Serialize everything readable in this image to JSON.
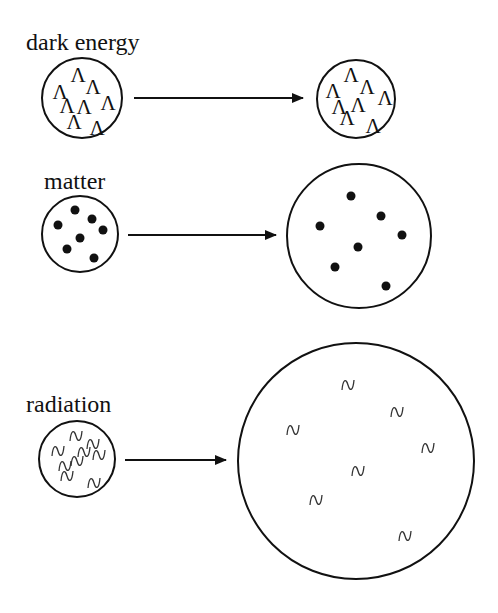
{
  "rows": [
    {
      "label": "dark energy",
      "symbol": "Λ",
      "before": {
        "cx": 82,
        "cy": 98,
        "r": 40
      },
      "after": {
        "cx": 356,
        "cy": 99,
        "r": 39
      },
      "arrow": {
        "x1": 134,
        "x2": 303,
        "y": 98
      },
      "before_marks": [
        [
          60,
          91
        ],
        [
          78,
          74
        ],
        [
          93,
          86
        ],
        [
          108,
          102
        ],
        [
          84,
          106
        ],
        [
          74,
          121
        ],
        [
          97,
          127
        ],
        [
          67,
          105
        ]
      ],
      "after_marks": [
        [
          333,
          90
        ],
        [
          351,
          74
        ],
        [
          367,
          86
        ],
        [
          385,
          97
        ],
        [
          358,
          104
        ],
        [
          347,
          117
        ],
        [
          373,
          125
        ],
        [
          339,
          106
        ]
      ]
    },
    {
      "label": "matter",
      "symbol": "•",
      "before": {
        "cx": 80,
        "cy": 234,
        "r": 38
      },
      "after": {
        "cx": 359,
        "cy": 236,
        "r": 72
      },
      "arrow": {
        "x1": 128,
        "x2": 276,
        "y": 235
      },
      "before_marks": [
        [
          75,
          210
        ],
        [
          58,
          225
        ],
        [
          92,
          219
        ],
        [
          103,
          230
        ],
        [
          80,
          238
        ],
        [
          67,
          249
        ],
        [
          94,
          258
        ]
      ],
      "after_marks": [
        [
          351,
          196
        ],
        [
          320,
          226
        ],
        [
          381,
          216
        ],
        [
          402,
          235
        ],
        [
          358,
          247
        ],
        [
          335,
          267
        ],
        [
          386,
          286
        ]
      ]
    },
    {
      "label": "radiation",
      "symbol": "∿",
      "before": {
        "cx": 77,
        "cy": 459,
        "r": 38
      },
      "after": {
        "cx": 356,
        "cy": 461,
        "r": 118
      },
      "arrow": {
        "x1": 125,
        "x2": 226,
        "y": 460
      },
      "before_marks": [
        [
          76,
          436
        ],
        [
          58,
          451
        ],
        [
          93,
          444
        ],
        [
          99,
          455
        ],
        [
          77,
          461
        ],
        [
          67,
          476
        ],
        [
          94,
          483
        ],
        [
          65,
          466
        ],
        [
          84,
          452
        ]
      ],
      "after_marks": [
        [
          348,
          385
        ],
        [
          397,
          412
        ],
        [
          293,
          430
        ],
        [
          428,
          448
        ],
        [
          358,
          471
        ],
        [
          316,
          500
        ],
        [
          405,
          536
        ]
      ]
    }
  ]
}
